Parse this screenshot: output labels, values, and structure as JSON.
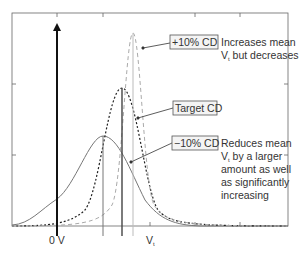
{
  "diagram": {
    "type": "distribution-comparison",
    "x_axis": {
      "labels": [
        {
          "text": "0 V",
          "position": "zero-volt"
        },
        {
          "text": "V",
          "subscript": "t",
          "position": "threshold"
        }
      ]
    },
    "curves": [
      {
        "name": "Target CD",
        "style": "dotted",
        "color": "#222222"
      },
      {
        "name": "+10% CD",
        "style": "dashed",
        "color": "#aaaaaa"
      },
      {
        "name": "−10% CD",
        "style": "solid",
        "color": "#777777"
      }
    ],
    "callouts": {
      "plus10": {
        "label": "+10% CD",
        "note_lines": [
          "Increases mean",
          "V",
          "t",
          " but decreases"
        ]
      },
      "target": {
        "label": "Target CD"
      },
      "minus10": {
        "label": "−10% CD",
        "note_lines": [
          "Reduces mean",
          "V",
          "t",
          " by a larger",
          "amount as well",
          "as significantly",
          "increasing"
        ]
      }
    },
    "zero_axis_label": "0 V",
    "vt_label_main": "V",
    "vt_label_sub": "t"
  }
}
